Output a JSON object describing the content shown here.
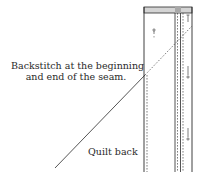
{
  "diagram": {
    "annotations": {
      "backstitch_line1": "Backstitch at the beginning",
      "backstitch_line2": "and end of the seam.",
      "quilt_back": "Quilt back"
    },
    "colors": {
      "line": "#2a2a2a",
      "strip_fill": "#d4d4d4",
      "strip_dark": "#a8a8a8",
      "background": "#ffffff"
    },
    "icons": [
      "pin-icon",
      "pin-icon",
      "pin-icon",
      "pin-icon"
    ]
  }
}
